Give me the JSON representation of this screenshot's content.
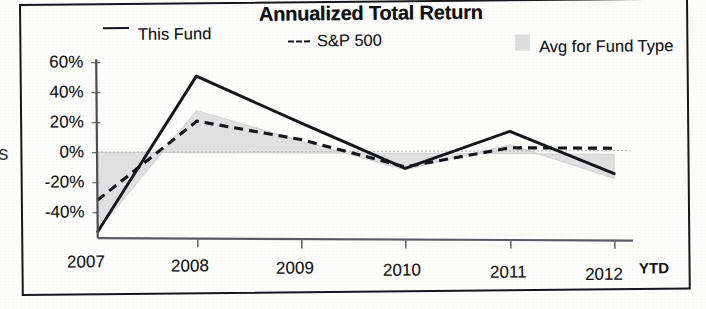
{
  "chart_data": {
    "type": "line",
    "title": "Annualized Total Return",
    "xlabel": "",
    "ylabel": "",
    "x": [
      "2007",
      "2008",
      "2009",
      "2010",
      "2011",
      "2012"
    ],
    "categories": [
      "2007",
      "2008",
      "2009",
      "2010",
      "2011",
      "2012"
    ],
    "xtick_labels": [
      "2007",
      "2008",
      "2009",
      "2010",
      "2011",
      "2012"
    ],
    "xaxis_note": "YTD",
    "ytick_labels": [
      "60%",
      "40%",
      "20%",
      "0%",
      "-20%",
      "-40%"
    ],
    "ytick_values": [
      60,
      40,
      20,
      0,
      -20,
      -40
    ],
    "ylim": [
      -55,
      62
    ],
    "grid": false,
    "legend_position": "top",
    "series": [
      {
        "name": "This Fund",
        "style": "solid",
        "color": "#141519",
        "values": [
          -53,
          51,
          20,
          -10,
          15,
          -13
        ]
      },
      {
        "name": "S&P 500",
        "style": "dashed",
        "color": "#141519",
        "values": [
          -32,
          21,
          9,
          -9,
          4,
          4
        ]
      },
      {
        "name": "Avg for Fund Type",
        "style": "shaded-area",
        "color": "#dcdcdc",
        "values": [
          -52,
          28,
          8,
          -11,
          6,
          -16
        ]
      }
    ]
  },
  "chart": {
    "title": "Annualized Total Return",
    "legend": [
      {
        "label": "This Fund",
        "marker": "solid-line"
      },
      {
        "label": "S&P 500",
        "marker": "dashed-line",
        "prefix": "---"
      },
      {
        "label": "Avg for Fund Type",
        "marker": "gray-swatch"
      }
    ],
    "y_axis": {
      "ticks": [
        "60%",
        "40%",
        "20%",
        "0%",
        "-20%",
        "-40%"
      ]
    },
    "x_axis": {
      "ticks": [
        "2007",
        "2008",
        "2009",
        "2010",
        "2011",
        "2012"
      ],
      "suffix": "YTD"
    }
  },
  "page": {
    "edge_fragment": "s"
  }
}
